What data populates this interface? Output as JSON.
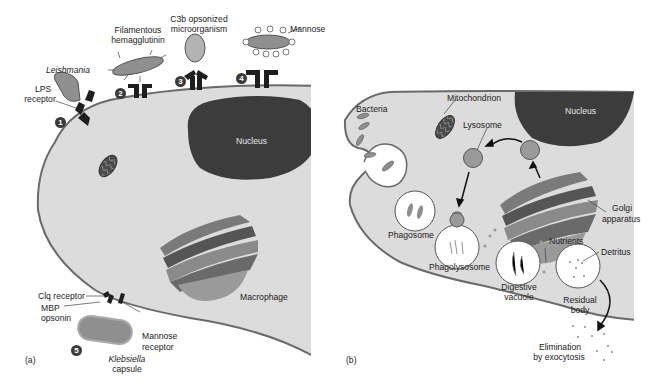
{
  "panel_a": {
    "tag": "(a)",
    "cell_label": "Macrophage",
    "nucleus_label": "Nucleus",
    "mechanisms": [
      {
        "number": "1",
        "organism": "Leishmania",
        "receptor": "LPS receptor",
        "receptor_line1": "LPS",
        "receptor_line2": "receptor"
      },
      {
        "number": "2",
        "organism_line1": "Filamentous",
        "organism_line2": "hemagglutinin"
      },
      {
        "number": "3",
        "organism_line1": "C3b opsonized",
        "organism_line2": "microorganism"
      },
      {
        "number": "4",
        "organism": "Mannose"
      },
      {
        "number": "5",
        "organism": "Klebsiella",
        "organism_suffix": "capsule",
        "labels": {
          "clq": "Clq receptor",
          "mbp_line1": "MBP",
          "mbp_line2": "opsonin",
          "mannose_line1": "Mannose",
          "mannose_line2": "receptor"
        }
      }
    ]
  },
  "panel_b": {
    "tag": "(b)",
    "labels": {
      "bacteria": "Bacteria",
      "mitochondrion": "Mitochondrion",
      "lysosome": "Lysosome",
      "nucleus": "Nucleus",
      "golgi_line1": "Golgi",
      "golgi_line2": "apparatus",
      "phagosome": "Phagosome",
      "phagolysosome": "Phagolysosome",
      "nutrients": "Nutrients",
      "digestive_line1": "Digestive",
      "digestive_line2": "vacuole",
      "detritus": "Detritus",
      "residual_line1": "Residual",
      "residual_line2": "body",
      "elimination_line1": "Elimination",
      "elimination_line2": "by exocytosis"
    }
  },
  "colors": {
    "cytoplasm": "#dcdcdc",
    "membrane": "#6a6a6a",
    "nucleus": "#3c3c3c",
    "organism": "#8f8f8f",
    "receptor": "#1e1e1e",
    "vesicle": "#9a9a9a"
  }
}
